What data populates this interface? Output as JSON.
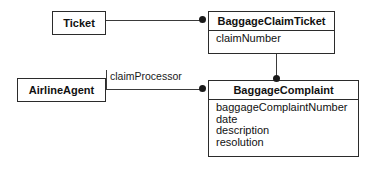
{
  "diagram": {
    "type": "uml-class-diagram",
    "background_color": "#ffffff",
    "line_color": "#3a3a3a",
    "border_color": "#2b2b2b",
    "text_color": "#111111"
  },
  "classes": {
    "ticket": {
      "name": "Ticket",
      "attributes": []
    },
    "baggage_claim_ticket": {
      "name": "BaggageClaimTicket",
      "attributes": [
        "claimNumber"
      ]
    },
    "airline_agent": {
      "name": "AirlineAgent",
      "attributes": []
    },
    "baggage_complaint": {
      "name": "BaggageComplaint",
      "attributes": [
        "baggageComplaintNumber",
        "date",
        "description",
        "resolution"
      ]
    }
  },
  "associations": [
    {
      "id": "ticket-to-baggageclaimticket",
      "from": "Ticket",
      "to": "BaggageClaimTicket",
      "role_label": "",
      "end_marker": "filled-dot"
    },
    {
      "id": "baggageclaimticket-to-baggagecomplaint",
      "from": "BaggageClaimTicket",
      "to": "BaggageComplaint",
      "role_label": "",
      "end_marker": "filled-dot"
    },
    {
      "id": "airlineagent-to-baggagecomplaint",
      "from": "AirlineAgent",
      "to": "BaggageComplaint",
      "role_label": "claimProcessor",
      "end_marker": "filled-dot"
    }
  ],
  "labels": {
    "claim_processor": "claimProcessor"
  }
}
